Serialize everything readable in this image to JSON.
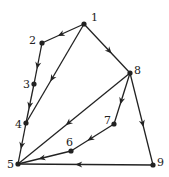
{
  "diagram": {
    "type": "directed-graph",
    "color": "#222222",
    "nodes": [
      {
        "id": "1",
        "label": "1",
        "x": 84,
        "y": 24,
        "lx": 91,
        "ly": 21
      },
      {
        "id": "2",
        "label": "2",
        "x": 42,
        "y": 43,
        "lx": 29,
        "ly": 44
      },
      {
        "id": "3",
        "label": "3",
        "x": 34,
        "y": 84,
        "lx": 23,
        "ly": 88
      },
      {
        "id": "4",
        "label": "4",
        "x": 26,
        "y": 123,
        "lx": 15,
        "ly": 128
      },
      {
        "id": "5",
        "label": "5",
        "x": 18,
        "y": 164,
        "lx": 7,
        "ly": 168
      },
      {
        "id": "6",
        "label": "6",
        "x": 71,
        "y": 151,
        "lx": 66,
        "ly": 146
      },
      {
        "id": "7",
        "label": "7",
        "x": 114,
        "y": 124,
        "lx": 104,
        "ly": 124
      },
      {
        "id": "8",
        "label": "8",
        "x": 130,
        "y": 73,
        "lx": 134,
        "ly": 74
      },
      {
        "id": "9",
        "label": "9",
        "x": 153,
        "y": 165,
        "lx": 157,
        "ly": 166
      }
    ],
    "edges": [
      {
        "from": "1",
        "to": "2"
      },
      {
        "from": "2",
        "to": "3"
      },
      {
        "from": "3",
        "to": "4"
      },
      {
        "from": "4",
        "to": "5"
      },
      {
        "from": "1",
        "to": "4"
      },
      {
        "from": "1",
        "to": "8"
      },
      {
        "from": "8",
        "to": "5"
      },
      {
        "from": "8",
        "to": "7"
      },
      {
        "from": "7",
        "to": "6"
      },
      {
        "from": "6",
        "to": "5"
      },
      {
        "from": "8",
        "to": "9"
      },
      {
        "from": "9",
        "to": "5"
      }
    ]
  }
}
